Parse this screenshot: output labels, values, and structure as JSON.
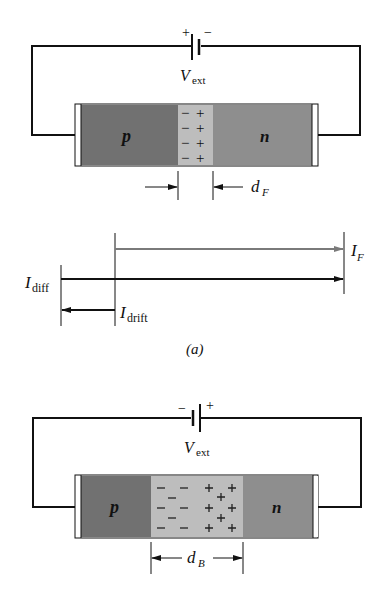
{
  "figure": {
    "forward": {
      "battery": {
        "plus": "+",
        "minus": "−",
        "label_main": "V",
        "label_sub": "ext"
      },
      "regions": {
        "p": "p",
        "n": "n"
      },
      "charges_neg": [
        "−",
        "−",
        "−",
        "−"
      ],
      "charges_pos": [
        "+",
        "+",
        "+",
        "+"
      ],
      "width_label_main": "d",
      "width_label_sub": "F"
    },
    "currents": {
      "I_F": {
        "main": "I",
        "sub": "F"
      },
      "I_diff": {
        "main": "I",
        "sub": "diff"
      },
      "I_drift": {
        "main": "I",
        "sub": "drift"
      }
    },
    "caption_a": "(a)",
    "reverse": {
      "battery": {
        "minus": "−",
        "plus": "+",
        "label_main": "V",
        "label_sub": "ext"
      },
      "regions": {
        "p": "p",
        "n": "n"
      },
      "width_label_main": "d",
      "width_label_sub": "B"
    }
  },
  "colors": {
    "p_region": "#717171",
    "n_region": "#8e8e8e",
    "depletion": "#bdbdbd",
    "wire": "#111111",
    "IF_arrow": "#7a7a7a"
  }
}
